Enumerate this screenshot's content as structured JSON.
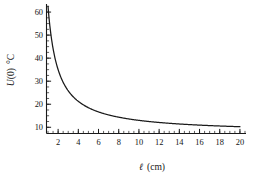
{
  "chart_data": {
    "type": "line",
    "title": "",
    "subtitle": "",
    "xlabel": "ℓ (cm)",
    "xlabel_symbol": "ℓ",
    "xlabel_units": "(cm)",
    "ylabel": "U(0) °C",
    "ylabel_symbol": "U",
    "ylabel_arg": "(0)",
    "ylabel_units": "°C",
    "xlim": [
      0.85,
      20.6
    ],
    "ylim": [
      7.3,
      63.5
    ],
    "grid": false,
    "legend": null,
    "legend_position": "none",
    "x_ticks_major": [
      2,
      4,
      6,
      8,
      10,
      12,
      14,
      16,
      18,
      20
    ],
    "x_tick_labels": [
      "2",
      "4",
      "6",
      "8",
      "10",
      "12",
      "14",
      "16",
      "18",
      "20"
    ],
    "x_tick_minor_step": 0.5,
    "y_ticks_major": [
      10,
      20,
      30,
      40,
      50,
      60
    ],
    "y_tick_labels": [
      "10",
      "20",
      "30",
      "40",
      "50",
      "60"
    ],
    "y_tick_minor_step": 2.5,
    "series": [
      {
        "name": "U(0)",
        "color": "#1a1a1a",
        "equation": "U = 7.5 + 55/ℓ",
        "x": [
          1.0,
          1.1,
          1.2,
          1.3,
          1.4,
          1.5,
          1.6,
          1.8,
          2.0,
          2.25,
          2.5,
          2.75,
          3.0,
          3.5,
          4.0,
          4.5,
          5.0,
          5.5,
          6.0,
          6.5,
          7.0,
          7.5,
          8.0,
          9.0,
          10.0,
          11.0,
          12.0,
          13.0,
          14.0,
          15.0,
          16.0,
          17.0,
          18.0,
          19.0,
          20.0
        ],
        "y": [
          62.5,
          57.5,
          53.3,
          49.8,
          46.8,
          44.2,
          41.9,
          38.1,
          35.0,
          31.9,
          29.5,
          27.5,
          25.8,
          23.2,
          21.3,
          19.7,
          18.5,
          17.5,
          16.7,
          16.0,
          15.4,
          14.8,
          14.4,
          13.6,
          13.0,
          12.5,
          12.1,
          11.7,
          11.4,
          11.2,
          10.9,
          10.7,
          10.6,
          10.4,
          10.3
        ]
      }
    ]
  }
}
